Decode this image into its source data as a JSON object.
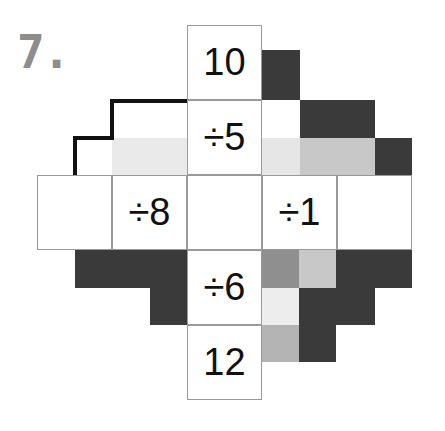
{
  "problem": {
    "number_label": "7."
  },
  "puzzle": {
    "type": "cross-shaped division puzzle",
    "grid_columns": 5,
    "grid_rows": 5,
    "cell_size_px": 75,
    "center_value": "",
    "arms": {
      "top": {
        "outer_label": "10",
        "inner_label": "÷5"
      },
      "bottom": {
        "inner_label": "÷6",
        "outer_label": "12"
      },
      "left": {
        "outer_label": "",
        "inner_label": "÷8"
      },
      "right": {
        "inner_label": "÷1",
        "outer_label": ""
      }
    },
    "cells": [
      {
        "name": "cell-top-outer",
        "col": 2,
        "row": 0,
        "text": "10"
      },
      {
        "name": "cell-top-inner",
        "col": 2,
        "row": 1,
        "text": "÷5"
      },
      {
        "name": "cell-left-outer",
        "col": 0,
        "row": 2,
        "text": ""
      },
      {
        "name": "cell-left-inner",
        "col": 1,
        "row": 2,
        "text": "÷8"
      },
      {
        "name": "cell-center",
        "col": 2,
        "row": 2,
        "text": ""
      },
      {
        "name": "cell-right-inner",
        "col": 3,
        "row": 2,
        "text": "÷1"
      },
      {
        "name": "cell-right-outer",
        "col": 4,
        "row": 2,
        "text": ""
      },
      {
        "name": "cell-bottom-inner",
        "col": 2,
        "row": 3,
        "text": "÷6"
      },
      {
        "name": "cell-bottom-outer",
        "col": 2,
        "row": 4,
        "text": "12"
      }
    ]
  },
  "colors": {
    "page_background": "#ffffff",
    "cell_fill": "#ffffff",
    "cell_border": "#9a9a9a",
    "text": "#111111",
    "problem_number": "#8d8d8d",
    "shade_dark": "#3a3a3a",
    "shade_medium": "#8f8f8f",
    "shade_light": "#c8c8c8",
    "shade_pale": "#e6e6e6",
    "outline_stroke": "#111111"
  }
}
